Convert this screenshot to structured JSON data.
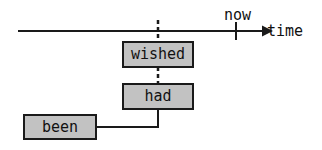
{
  "diagram": {
    "axis": {
      "label": "time",
      "marker_label": "now",
      "line_color": "#1a1a1a",
      "start_x": 18,
      "end_x": 266,
      "y": 31,
      "now_tick_x": 236
    },
    "nodes": [
      {
        "id": "wished",
        "label": "wished",
        "fill": "#c2c2c2",
        "border": "#1a1a1a"
      },
      {
        "id": "had",
        "label": "had",
        "fill": "#c2c2c2",
        "border": "#1a1a1a"
      },
      {
        "id": "been",
        "label": "been",
        "fill": "#c2c2c2",
        "border": "#1a1a1a"
      }
    ],
    "connectors": [
      {
        "id": "axis-to-wished",
        "style": "dashed",
        "from": "time-axis",
        "to": "wished"
      },
      {
        "id": "wished-to-had",
        "style": "dashed",
        "from": "wished",
        "to": "had"
      },
      {
        "id": "had-to-been",
        "style": "solid",
        "from": "had",
        "to": "been"
      }
    ]
  }
}
